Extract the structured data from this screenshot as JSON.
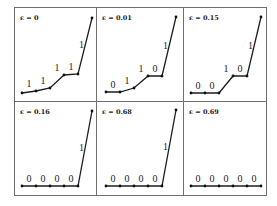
{
  "figure": {
    "layout": {
      "rows": 2,
      "cols": 3
    },
    "panels": [
      {
        "label": "ε = 0",
        "segment_labels": [
          "1",
          "1",
          "1",
          "1",
          "1"
        ],
        "points": [
          [
            22,
            93
          ],
          [
            36,
            91
          ],
          [
            50,
            88
          ],
          [
            64,
            75
          ],
          [
            78,
            74
          ],
          [
            92,
            18
          ]
        ]
      },
      {
        "label": "ε = 0.01",
        "segment_labels": [
          "0",
          "1",
          "1",
          "0",
          "1"
        ],
        "points": [
          [
            106,
            92
          ],
          [
            120,
            92
          ],
          [
            134,
            88
          ],
          [
            148,
            76
          ],
          [
            162,
            76
          ],
          [
            176,
            17
          ]
        ]
      },
      {
        "label": "ε = 0.15",
        "segment_labels": [
          "0",
          "0",
          "1",
          "0",
          "1"
        ],
        "points": [
          [
            191,
            93
          ],
          [
            205,
            93
          ],
          [
            219,
            93
          ],
          [
            233,
            76
          ],
          [
            247,
            76
          ],
          [
            261,
            17
          ]
        ]
      },
      {
        "label": "ε = 0.16",
        "segment_labels": [
          "0",
          "0",
          "0",
          "0",
          "1"
        ],
        "points": [
          [
            22,
            186
          ],
          [
            36,
            186
          ],
          [
            50,
            186
          ],
          [
            64,
            186
          ],
          [
            78,
            186
          ],
          [
            92,
            111
          ]
        ]
      },
      {
        "label": "ε = 0.68",
        "segment_labels": [
          "0",
          "0",
          "0",
          "0",
          "1"
        ],
        "points": [
          [
            106,
            186
          ],
          [
            120,
            186
          ],
          [
            134,
            186
          ],
          [
            148,
            186
          ],
          [
            162,
            186
          ],
          [
            176,
            110
          ]
        ]
      },
      {
        "label": "ε = 0.69",
        "segment_labels": [
          "0",
          "0",
          "0",
          "0",
          "0"
        ],
        "points": [
          [
            191,
            186
          ],
          [
            205,
            186
          ],
          [
            219,
            186
          ],
          [
            233,
            186
          ],
          [
            247,
            186
          ],
          [
            261,
            186
          ]
        ]
      }
    ]
  }
}
